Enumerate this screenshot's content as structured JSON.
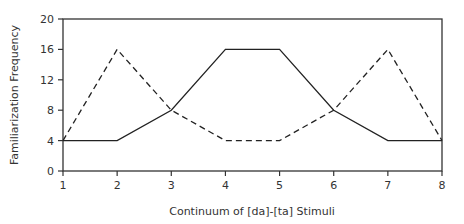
{
  "chart_data": {
    "type": "line",
    "title": "",
    "xlabel": "Continuum of [da]-[ta] Stimuli",
    "ylabel": "Familiarization Frequency",
    "x": [
      1,
      2,
      3,
      4,
      5,
      6,
      7,
      8
    ],
    "xlim": [
      1,
      8
    ],
    "ylim": [
      0,
      20
    ],
    "yticks": [
      0,
      4,
      8,
      12,
      16,
      20
    ],
    "xticks": [
      1,
      2,
      3,
      4,
      5,
      6,
      7,
      8
    ],
    "grid": false,
    "legend": "none",
    "series": [
      {
        "name": "Solid line",
        "style": "solid",
        "color": "#222222",
        "values": [
          4,
          4,
          8,
          16,
          16,
          8,
          4,
          4
        ]
      },
      {
        "name": "Dashed line",
        "style": "dashed",
        "color": "#222222",
        "values": [
          4,
          16,
          8,
          4,
          4,
          8,
          16,
          4
        ]
      }
    ]
  }
}
